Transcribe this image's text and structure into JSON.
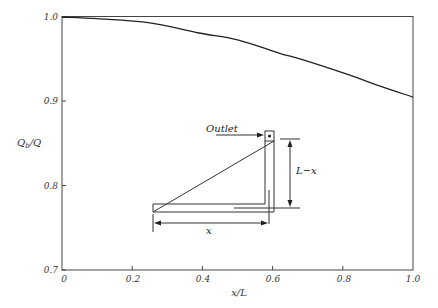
{
  "chart_data": {
    "type": "line",
    "title": "",
    "xlabel": "x/L",
    "ylabel": "Q_b/Q",
    "xlim": [
      0,
      1.0
    ],
    "ylim": [
      0.7,
      1.0
    ],
    "xticks": [
      "0",
      "0.2",
      "0.4",
      "0.6",
      "0.8",
      "1.0"
    ],
    "yticks": [
      "0.7",
      "0.8",
      "0.9",
      "1.0"
    ],
    "grid": false,
    "legend": null,
    "series": [
      {
        "name": "Q_b/Q",
        "x": [
          0,
          0.1,
          0.25,
          0.39,
          0.5,
          0.62,
          0.68,
          0.82,
          0.9,
          1.0
        ],
        "y": [
          1.0,
          0.998,
          0.993,
          0.981,
          0.973,
          0.957,
          0.95,
          0.931,
          0.919,
          0.905
        ]
      }
    ],
    "inset_diagram": {
      "labels": {
        "outlet": "Outlet",
        "vertical_length": "L−x",
        "horizontal_length": "x"
      }
    }
  },
  "axes": {
    "xlabel": "x/L",
    "ylabel_main": "Q",
    "ylabel_sub": "b",
    "ylabel_tail": "/Q",
    "xticks": [
      "0",
      "0.2",
      "0.4",
      "0.6",
      "0.8",
      "1.0"
    ],
    "yticks": [
      "0.7",
      "0.8",
      "0.9",
      "1.0"
    ]
  },
  "inset": {
    "outlet": "Outlet",
    "vertical_length": "L−x",
    "horizontal_length": "x"
  }
}
